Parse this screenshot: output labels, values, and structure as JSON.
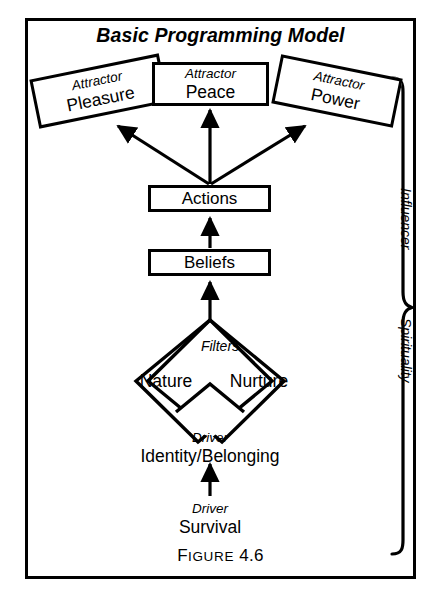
{
  "figure": {
    "title": "Basic Programming Model",
    "caption": {
      "lead": "F",
      "word": "IGURE",
      "number": "4.6"
    },
    "border_color": "#000000",
    "background_color": "#ffffff"
  },
  "attractors": [
    {
      "kicker": "Attractor",
      "label": "Pleasure",
      "name": "attractor-pleasure"
    },
    {
      "kicker": "Attractor",
      "label": "Peace",
      "name": "attractor-peace"
    },
    {
      "kicker": "Attractor",
      "label": "Power",
      "name": "attractor-power"
    }
  ],
  "chain": [
    {
      "label": "Actions",
      "name": "actions"
    },
    {
      "label": "Beliefs",
      "name": "beliefs"
    }
  ],
  "filters": {
    "heading": "Filters",
    "left": "Nature",
    "right": "Nurture"
  },
  "drivers": [
    {
      "kicker": "Driver",
      "label": "Identity/Belonging",
      "name": "driver-identity-belonging"
    },
    {
      "kicker": "Driver",
      "label": "Survival",
      "name": "driver-survival"
    }
  ],
  "brace": {
    "upper_label": "Influencer",
    "lower_label": "Spirituality"
  }
}
